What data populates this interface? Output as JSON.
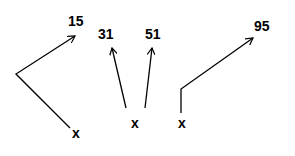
{
  "diagrams": [
    {
      "id": "group-1",
      "source_label": "x",
      "targets": [
        "15"
      ]
    },
    {
      "id": "group-2",
      "source_label": "x",
      "targets": [
        "31",
        "51"
      ]
    },
    {
      "id": "group-3",
      "source_label": "x",
      "targets": [
        "95"
      ]
    }
  ],
  "colors": {
    "stroke": "#000000",
    "background": "#ffffff"
  }
}
